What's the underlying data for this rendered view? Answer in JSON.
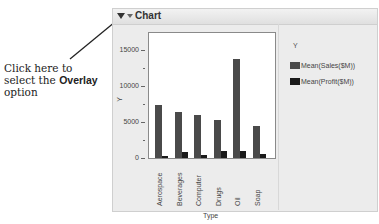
{
  "callout": {
    "line1": "Click here to",
    "line2_prefix": "select the ",
    "line2_bold": "Overlay",
    "line3": "option"
  },
  "panel": {
    "title": "Chart"
  },
  "legend": {
    "title": "Y",
    "items": [
      {
        "label": "Mean(Sales($M))",
        "color": "#4a4a4a"
      },
      {
        "label": "Mean(Profit($M))",
        "color": "#1a1a1a"
      }
    ]
  },
  "chart_data": {
    "type": "bar",
    "title": "Chart",
    "xlabel": "Type",
    "ylabel": "Y",
    "categories": [
      "Aerospace",
      "Beverages",
      "Computer",
      "Drugs",
      "Oil",
      "Soap"
    ],
    "series": [
      {
        "name": "Mean(Sales($M))",
        "values": [
          7400,
          6400,
          6000,
          5300,
          13700,
          4500
        ],
        "color": "#4a4a4a"
      },
      {
        "name": "Mean(Profit($M))",
        "values": [
          300,
          800,
          400,
          1000,
          1000,
          500
        ],
        "color": "#1a1a1a"
      }
    ],
    "ylim": [
      -400,
      17000
    ],
    "yticks": [
      0,
      5000,
      10000,
      15000
    ],
    "ytick_labels": [
      "0",
      "5000",
      "10000",
      "15000"
    ],
    "grid": false,
    "legend_position": "right"
  }
}
